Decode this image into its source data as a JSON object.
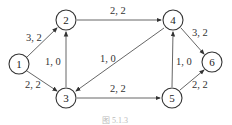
{
  "nodes": [
    {
      "id": "1",
      "label": "1",
      "x": 19,
      "y": 64
    },
    {
      "id": "2",
      "label": "2",
      "x": 66,
      "y": 20
    },
    {
      "id": "3",
      "label": "3",
      "x": 66,
      "y": 98
    },
    {
      "id": "4",
      "label": "4",
      "x": 173,
      "y": 20
    },
    {
      "id": "5",
      "label": "5",
      "x": 172,
      "y": 98
    },
    {
      "id": "6",
      "label": "6",
      "x": 212,
      "y": 62
    }
  ],
  "edges": [
    {
      "from": "1",
      "to": "2",
      "label": "3, 2"
    },
    {
      "from": "1",
      "to": "3",
      "label": "2, 2"
    },
    {
      "from": "3",
      "to": "2",
      "label": "1, 0"
    },
    {
      "from": "2",
      "to": "4",
      "label": "2, 2"
    },
    {
      "from": "4",
      "to": "3",
      "label": "1, 0"
    },
    {
      "from": "3",
      "to": "5",
      "label": "2, 2"
    },
    {
      "from": "5",
      "to": "4",
      "label": "1, 0"
    },
    {
      "from": "4",
      "to": "6",
      "label": "3, 2"
    },
    {
      "from": "5",
      "to": "6",
      "label": "2, 2"
    }
  ],
  "caption": "图 5.1.3"
}
